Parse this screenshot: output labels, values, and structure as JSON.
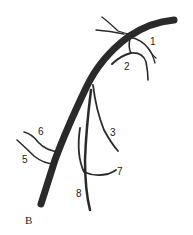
{
  "figure": {
    "panel_label": "B",
    "branch_labels": [
      {
        "id": "1",
        "x": 150,
        "y": 37
      },
      {
        "id": "2",
        "x": 124,
        "y": 62
      },
      {
        "id": "3",
        "x": 110,
        "y": 128
      },
      {
        "id": "6",
        "x": 38,
        "y": 127
      },
      {
        "id": "5",
        "x": 22,
        "y": 155
      },
      {
        "id": "7",
        "x": 117,
        "y": 167
      },
      {
        "id": "8",
        "x": 76,
        "y": 189
      }
    ],
    "colors": {
      "vessel": "#2a2a2a",
      "background": "#ffffff"
    }
  }
}
